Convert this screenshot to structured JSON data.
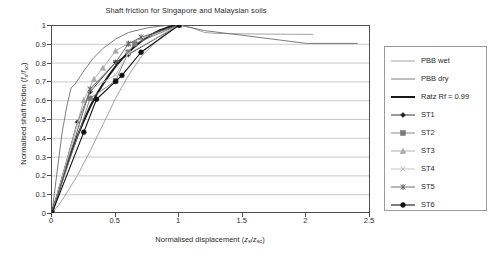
{
  "chart_data": {
    "type": "line",
    "title": "Shaft friction for Singapore and Malaysian soils",
    "xlabel": "Normalised displacement (zs/zsc)",
    "xlabel_parts": {
      "text": "Normalised displacement (",
      "v1": "z",
      "s1": "s",
      "slash": "/",
      "v2": "z",
      "s2": "sc",
      "close": ")"
    },
    "ylabel": "Normalised shaft friction (fs/fsc)",
    "ylabel_parts": {
      "text": "Normalised shaft friction (",
      "v1": "f",
      "s1": "s",
      "slash": "/",
      "v2": "f",
      "s2": "sc",
      "close": ")"
    },
    "xlim": [
      0,
      2.5
    ],
    "ylim": [
      0,
      1
    ],
    "xticks": [
      0,
      0.5,
      1,
      1.5,
      2,
      2.5
    ],
    "xticklabels": [
      "0",
      "0.5",
      "1",
      "1.5",
      "2",
      "2.5"
    ],
    "yticks": [
      0,
      0.1,
      0.2,
      0.3,
      0.4,
      0.5,
      0.6,
      0.7,
      0.8,
      0.9,
      1
    ],
    "yticklabels": [
      "0",
      "0.1",
      "0.2",
      "0.3",
      "0.4",
      "0.5",
      "0.6",
      "0.7",
      "0.8",
      "0.9",
      "1"
    ],
    "grid": "horizontal",
    "grid_color": "#b3b3b3",
    "legend_position": "right-outside",
    "series": [
      {
        "name": "PBB wet",
        "color": "#8c8c8c",
        "width": 0.8,
        "marker": "none",
        "points": [
          [
            0,
            0
          ],
          [
            0.05,
            0.04
          ],
          [
            0.1,
            0.09
          ],
          [
            0.2,
            0.2
          ],
          [
            0.3,
            0.33
          ],
          [
            0.4,
            0.47
          ],
          [
            0.5,
            0.61
          ],
          [
            0.6,
            0.73
          ],
          [
            0.7,
            0.83
          ],
          [
            0.8,
            0.9
          ],
          [
            0.9,
            0.96
          ],
          [
            1.0,
            1.0
          ],
          [
            1.1,
            0.985
          ],
          [
            1.2,
            0.96
          ],
          [
            1.3,
            0.955
          ],
          [
            1.6,
            0.952
          ],
          [
            2.05,
            0.95
          ]
        ]
      },
      {
        "name": "PBB dry",
        "color": "#6e6e6e",
        "width": 0.9,
        "marker": "none",
        "points": [
          [
            0,
            0
          ],
          [
            0.04,
            0.22
          ],
          [
            0.08,
            0.43
          ],
          [
            0.12,
            0.58
          ],
          [
            0.15,
            0.665
          ],
          [
            0.18,
            0.685
          ],
          [
            0.25,
            0.755
          ],
          [
            0.32,
            0.82
          ],
          [
            0.4,
            0.875
          ],
          [
            0.5,
            0.925
          ],
          [
            0.6,
            0.96
          ],
          [
            0.75,
            0.985
          ],
          [
            0.9,
            0.998
          ],
          [
            1.0,
            1.0
          ],
          [
            1.2,
            0.97
          ],
          [
            1.5,
            0.945
          ],
          [
            2.0,
            0.902
          ],
          [
            2.4,
            0.902
          ]
        ]
      },
      {
        "name": "Ratz Rf = 0.99",
        "color": "#1a1a1a",
        "width": 2.0,
        "marker": "none",
        "points": [
          [
            0,
            0
          ],
          [
            0.05,
            0.11
          ],
          [
            0.1,
            0.22
          ],
          [
            0.15,
            0.32
          ],
          [
            0.2,
            0.41
          ],
          [
            0.25,
            0.49
          ],
          [
            0.3,
            0.565
          ],
          [
            0.35,
            0.63
          ],
          [
            0.4,
            0.685
          ],
          [
            0.45,
            0.735
          ],
          [
            0.5,
            0.78
          ],
          [
            0.55,
            0.82
          ],
          [
            0.6,
            0.855
          ],
          [
            0.65,
            0.885
          ],
          [
            0.7,
            0.912
          ],
          [
            0.75,
            0.935
          ],
          [
            0.8,
            0.955
          ],
          [
            0.85,
            0.972
          ],
          [
            0.9,
            0.985
          ],
          [
            0.95,
            0.995
          ],
          [
            1.0,
            1.0
          ]
        ]
      },
      {
        "name": "ST1",
        "color": "#1f1f1f",
        "width": 0.9,
        "marker": "diamond-filled",
        "points": [
          [
            0,
            0
          ],
          [
            0.2,
            0.483
          ],
          [
            0.3,
            0.645
          ],
          [
            0.5,
            0.802
          ],
          [
            0.6,
            0.843
          ],
          [
            1.0,
            1.0
          ]
        ]
      },
      {
        "name": "ST2",
        "color": "#7a7a7a",
        "width": 0.9,
        "marker": "square-filled",
        "points": [
          [
            0,
            0
          ],
          [
            0.3,
            0.61
          ],
          [
            0.5,
            0.703
          ],
          [
            0.6,
            0.855
          ],
          [
            0.65,
            0.9
          ],
          [
            1.0,
            1.0
          ]
        ]
      },
      {
        "name": "ST3",
        "color": "#a8a8a8",
        "width": 0.9,
        "marker": "triangle-filled",
        "points": [
          [
            0,
            0
          ],
          [
            0.25,
            0.6
          ],
          [
            0.33,
            0.712
          ],
          [
            0.4,
            0.772
          ],
          [
            0.5,
            0.862
          ],
          [
            0.6,
            0.902
          ],
          [
            1.0,
            1.0
          ]
        ]
      },
      {
        "name": "ST4",
        "color": "#bdbdbd",
        "width": 0.9,
        "marker": "cross-x",
        "points": [
          [
            0,
            0
          ],
          [
            0.2,
            0.47
          ],
          [
            0.3,
            0.655
          ],
          [
            0.5,
            0.735
          ],
          [
            0.6,
            0.848
          ],
          [
            1.0,
            1.0
          ]
        ]
      },
      {
        "name": "ST5",
        "color": "#5e5e5e",
        "width": 0.9,
        "marker": "asterisk",
        "points": [
          [
            0,
            0
          ],
          [
            0.3,
            0.66
          ],
          [
            0.5,
            0.8
          ],
          [
            0.6,
            0.9
          ],
          [
            0.7,
            0.935
          ],
          [
            1.0,
            1.0
          ]
        ]
      },
      {
        "name": "ST6",
        "color": "#111111",
        "width": 1.1,
        "marker": "circle-filled",
        "points": [
          [
            0,
            0
          ],
          [
            0.25,
            0.43
          ],
          [
            0.35,
            0.605
          ],
          [
            0.5,
            0.7
          ],
          [
            0.55,
            0.732
          ],
          [
            0.7,
            0.855
          ],
          [
            1.0,
            1.0
          ]
        ]
      }
    ]
  },
  "legend": {
    "items": [
      {
        "label": "PBB wet"
      },
      {
        "label": "PBB dry"
      },
      {
        "label": "Ratz Rf = 0.99"
      },
      {
        "label": "ST1"
      },
      {
        "label": "ST2"
      },
      {
        "label": "ST3"
      },
      {
        "label": "ST4"
      },
      {
        "label": "ST5"
      },
      {
        "label": "ST6"
      }
    ]
  }
}
